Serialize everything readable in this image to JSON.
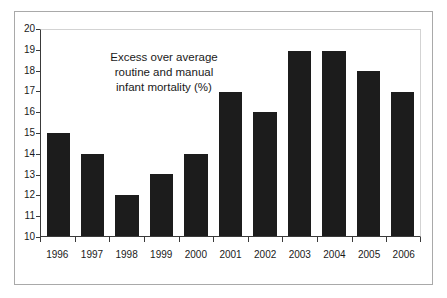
{
  "chart_data": {
    "type": "bar",
    "title": "",
    "subtitle": "",
    "xlabel": "",
    "ylabel": "",
    "categories": [
      "1996",
      "1997",
      "1998",
      "1999",
      "2000",
      "2001",
      "2002",
      "2003",
      "2004",
      "2005",
      "2006"
    ],
    "values": [
      15,
      14,
      12,
      13,
      14,
      17,
      16,
      19,
      19,
      18,
      17
    ],
    "ylim": [
      10,
      20
    ],
    "ytick_step": 1,
    "yticks": [
      "20",
      "19",
      "18",
      "17",
      "16",
      "15",
      "14",
      "13",
      "12",
      "11",
      "10"
    ],
    "grid": false,
    "legend": null,
    "annotations": [
      {
        "position": "upper-left-inside-plot",
        "lines": [
          "Excess over average",
          "routine and manual",
          "infant mortality (%)"
        ]
      }
    ],
    "colors": {
      "bar": "#1c1c1c",
      "axis": "#3a3a3a",
      "plot_border": "#d3d3d3",
      "frame_border": "#a9a9a9",
      "background": "#ffffff",
      "text": "#1a1a1a"
    }
  }
}
